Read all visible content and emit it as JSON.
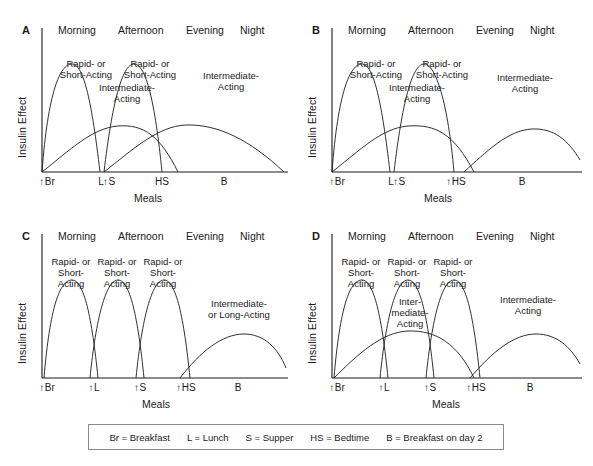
{
  "figure": {
    "axis_labels": {
      "y": "Insulin Effect",
      "x": "Meals"
    },
    "dayparts": [
      "Morning",
      "Afternoon",
      "Evening",
      "Night"
    ],
    "arrow_glyph": "↑"
  },
  "legend": {
    "items": [
      "Br = Breakfast",
      "L = Lunch",
      "S = Supper",
      "HS = Bedtime",
      "B = Breakfast on day 2"
    ]
  },
  "panels": [
    {
      "letter": "A",
      "ticks": [
        {
          "label": "Br",
          "arrow": true
        },
        {
          "label": "L",
          "arrow": false
        },
        {
          "label": "S",
          "arrow": true
        },
        {
          "label": "HS",
          "arrow": false
        },
        {
          "label": "B",
          "arrow": false
        }
      ],
      "curve_labels": [
        {
          "text": "Rapid- or\nShort-Acting"
        },
        {
          "text": "Intermediate-\nActing"
        },
        {
          "text": "Rapid- or\nShort-Acting"
        },
        {
          "text": "Intermediate-\nActing"
        }
      ]
    },
    {
      "letter": "B",
      "ticks": [
        {
          "label": "Br",
          "arrow": true
        },
        {
          "label": "L",
          "arrow": false
        },
        {
          "label": "S",
          "arrow": true
        },
        {
          "label": "HS",
          "arrow": true
        },
        {
          "label": "B",
          "arrow": false
        }
      ],
      "curve_labels": [
        {
          "text": "Rapid- or\nShort-Acting"
        },
        {
          "text": "Intermediate-\nActing"
        },
        {
          "text": "Rapid- or\nShort-Acting"
        },
        {
          "text": "Intermediate-\nActing"
        }
      ]
    },
    {
      "letter": "C",
      "ticks": [
        {
          "label": "Br",
          "arrow": true
        },
        {
          "label": "L",
          "arrow": true
        },
        {
          "label": "S",
          "arrow": true
        },
        {
          "label": "HS",
          "arrow": true
        },
        {
          "label": "B",
          "arrow": false
        }
      ],
      "curve_labels": [
        {
          "text": "Rapid- or\nShort-\nActing"
        },
        {
          "text": "Rapid- or\nShort-\nActing"
        },
        {
          "text": "Rapid- or\nShort-\nActing"
        },
        {
          "text": "Intermediate-\nor Long-Acting"
        }
      ]
    },
    {
      "letter": "D",
      "ticks": [
        {
          "label": "Br",
          "arrow": true
        },
        {
          "label": "L",
          "arrow": true
        },
        {
          "label": "S",
          "arrow": true
        },
        {
          "label": "HS",
          "arrow": true
        },
        {
          "label": "B",
          "arrow": false
        }
      ],
      "curve_labels": [
        {
          "text": "Rapid- or\nShort-\nActing"
        },
        {
          "text": "Rapid- or\nShort-\nActing"
        },
        {
          "text": "Rapid- or\nShort-\nActing"
        },
        {
          "text": "Inter-\nmediate-\nActing"
        },
        {
          "text": "Intermediate-\nActing"
        }
      ]
    }
  ],
  "chart_data": {
    "type": "line",
    "xlabel": "Meals",
    "ylabel": "Insulin Effect",
    "grid": false,
    "legend_position": "below-figure",
    "x_tick_labels": [
      "Br",
      "L",
      "S",
      "HS",
      "B"
    ],
    "x_tick_positions": [
      0,
      25,
      50,
      72,
      100
    ],
    "ylim": [
      0,
      100
    ],
    "panels": [
      {
        "letter": "A",
        "injections_at": [
          "Br",
          "S"
        ],
        "series": [
          {
            "name": "Rapid- or Short-Acting (breakfast)",
            "peak_x": 12,
            "peak_y": 78,
            "start_x": 0,
            "end_x": 25
          },
          {
            "name": "Intermediate-Acting (breakfast)",
            "peak_x": 33,
            "peak_y": 42,
            "start_x": 0,
            "end_x": 72
          },
          {
            "name": "Rapid- or Short-Acting (supper)",
            "peak_x": 61,
            "peak_y": 78,
            "start_x": 50,
            "end_x": 72
          },
          {
            "name": "Intermediate-Acting (supper)",
            "peak_x": 82,
            "peak_y": 42,
            "start_x": 50,
            "end_x": 100
          }
        ]
      },
      {
        "letter": "B",
        "injections_at": [
          "Br",
          "S",
          "HS"
        ],
        "series": [
          {
            "name": "Rapid- or Short-Acting (breakfast)",
            "peak_x": 12,
            "peak_y": 78,
            "start_x": 0,
            "end_x": 25
          },
          {
            "name": "Intermediate-Acting (breakfast)",
            "peak_x": 33,
            "peak_y": 42,
            "start_x": 0,
            "end_x": 72
          },
          {
            "name": "Rapid- or Short-Acting (supper)",
            "peak_x": 61,
            "peak_y": 78,
            "start_x": 50,
            "end_x": 72
          },
          {
            "name": "Intermediate-Acting (bedtime)",
            "peak_x": 86,
            "peak_y": 42,
            "start_x": 72,
            "end_x": 100
          }
        ]
      },
      {
        "letter": "C",
        "injections_at": [
          "Br",
          "L",
          "S",
          "HS"
        ],
        "series": [
          {
            "name": "Rapid- or Short-Acting (breakfast)",
            "peak_x": 12,
            "peak_y": 78,
            "start_x": 0,
            "end_x": 27
          },
          {
            "name": "Rapid- or Short-Acting (lunch)",
            "peak_x": 37,
            "peak_y": 78,
            "start_x": 24,
            "end_x": 52
          },
          {
            "name": "Rapid- or Short-Acting (supper)",
            "peak_x": 61,
            "peak_y": 78,
            "start_x": 49,
            "end_x": 73
          },
          {
            "name": "Intermediate- or Long-Acting (bedtime)",
            "peak_x": 86,
            "peak_y": 40,
            "start_x": 70,
            "end_x": 100
          }
        ]
      },
      {
        "letter": "D",
        "injections_at": [
          "Br",
          "L",
          "S",
          "HS"
        ],
        "series": [
          {
            "name": "Rapid- or Short-Acting (breakfast)",
            "peak_x": 12,
            "peak_y": 78,
            "start_x": 0,
            "end_x": 27
          },
          {
            "name": "Rapid- or Short-Acting (lunch)",
            "peak_x": 37,
            "peak_y": 78,
            "start_x": 24,
            "end_x": 52
          },
          {
            "name": "Rapid- or Short-Acting (supper)",
            "peak_x": 61,
            "peak_y": 78,
            "start_x": 49,
            "end_x": 73
          },
          {
            "name": "Intermediate-Acting (breakfast)",
            "peak_x": 37,
            "peak_y": 42,
            "start_x": 0,
            "end_x": 72
          },
          {
            "name": "Intermediate-Acting (bedtime)",
            "peak_x": 86,
            "peak_y": 42,
            "start_x": 72,
            "end_x": 100
          }
        ]
      }
    ]
  }
}
